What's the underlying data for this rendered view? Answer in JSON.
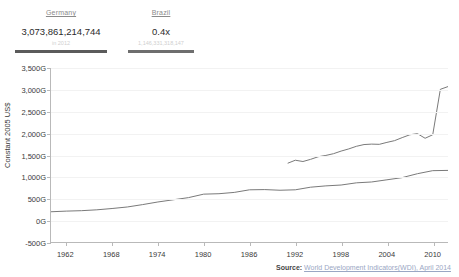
{
  "stats": {
    "germany": {
      "name": "Germany",
      "value": "3,073,861,214,744",
      "sub": "in 2012"
    },
    "brazil": {
      "name": "Brazil",
      "value": "0.4x",
      "sub": "1,146,331,318,147"
    }
  },
  "source": {
    "label": "Source:",
    "link": "World Development Indicators(WDI), April 2014"
  },
  "colors": {
    "line_germany": "#7a7a7a",
    "line_brazil": "#7a7a7a",
    "axis": "#b9b9b9",
    "grid": "#f2f2f2",
    "text": "#3a3a3a",
    "bar": "#5b5b5b"
  },
  "chart_data": {
    "type": "line",
    "title": "",
    "xlabel": "",
    "ylabel": "Constant 2005 US$",
    "xlim": [
      1960,
      2012
    ],
    "ylim": [
      -500,
      3500
    ],
    "ytick_labels": [
      "3,500G",
      "3,000G",
      "2,500G",
      "2,000G",
      "1,500G",
      "1,000G",
      "500G",
      "0G",
      "-500G"
    ],
    "ytick_values": [
      3500,
      3000,
      2500,
      2000,
      1500,
      1000,
      500,
      0,
      -500
    ],
    "xtick_labels": [
      "1962",
      "1968",
      "1974",
      "1980",
      "1986",
      "1992",
      "1998",
      "2004",
      "2010"
    ],
    "xtick_values": [
      1962,
      1968,
      1974,
      1980,
      1986,
      1992,
      1998,
      2004,
      2010
    ],
    "grid": true,
    "legend": "none",
    "units": "billions (G) of constant 2005 US dollars",
    "series": [
      {
        "name": "Germany",
        "x": [
          1991,
          1992,
          1993,
          1994,
          1995,
          1996,
          1997,
          1998,
          1999,
          2000,
          2001,
          2002,
          2003,
          2004,
          2005,
          2006,
          2007,
          2008,
          2009,
          2010,
          2011,
          2012
        ],
        "values": [
          1310,
          1380,
          1350,
          1400,
          1460,
          1490,
          1530,
          1590,
          1640,
          1700,
          1740,
          1750,
          1745,
          1790,
          1830,
          1900,
          1965,
          1990,
          1885,
          1965,
          3010,
          3073
        ]
      },
      {
        "name": "Brazil",
        "x": [
          1960,
          1962,
          1964,
          1966,
          1968,
          1970,
          1972,
          1974,
          1976,
          1978,
          1980,
          1982,
          1984,
          1986,
          1988,
          1990,
          1992,
          1994,
          1996,
          1998,
          2000,
          2002,
          2004,
          2006,
          2008,
          2010,
          2012
        ],
        "values": [
          195,
          210,
          220,
          240,
          270,
          305,
          360,
          420,
          470,
          520,
          600,
          610,
          640,
          700,
          705,
          690,
          700,
          760,
          790,
          810,
          860,
          880,
          930,
          980,
          1070,
          1140,
          1146
        ]
      }
    ]
  }
}
